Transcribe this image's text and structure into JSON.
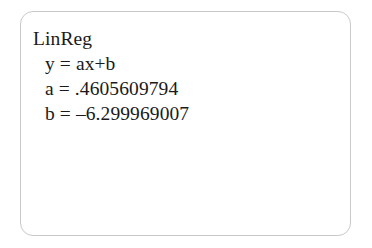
{
  "panel": {
    "border_color": "#c9c9c9",
    "background_color": "#ffffff",
    "text_color": "#1a1a1a"
  },
  "regression_output": {
    "title": "LinReg",
    "equation": "y = ax+b",
    "slope_line": "a = .4605609794",
    "intercept_line": "b = –6.299969007",
    "slope_label": "a",
    "slope_value": ".4605609794",
    "intercept_label": "b",
    "intercept_value": "–6.299969007"
  }
}
